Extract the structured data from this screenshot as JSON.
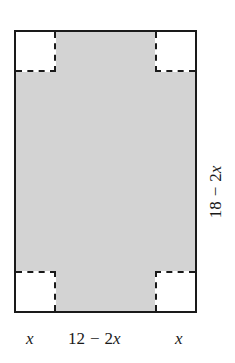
{
  "figure": {
    "kind": "geometry-diagram",
    "colors": {
      "outline": "#1a1a1a",
      "shaded_fill": "#d3d3d3",
      "cutout_fill": "#ffffff",
      "background": "#ffffff"
    },
    "sheet": {
      "outer_width_label": "12",
      "outer_height_label": "18",
      "corner_cut_label": "x"
    },
    "labels": {
      "bottom_left": {
        "variable": "x"
      },
      "bottom_middle": {
        "number": "12",
        "operator": "−",
        "coefficient": "2",
        "variable": "x",
        "full": "12 − 2x"
      },
      "bottom_right": {
        "variable": "x"
      },
      "right_side": {
        "number": "18",
        "operator": "−",
        "coefficient": "2",
        "variable": "x",
        "full": "18 − 2x",
        "orientation": "rotated-90-ccw"
      }
    },
    "corners": [
      {
        "name": "top-left",
        "solid_edges": "top,left",
        "dashed_edges": "right,bottom"
      },
      {
        "name": "top-right",
        "solid_edges": "top,right",
        "dashed_edges": "left,bottom"
      },
      {
        "name": "bottom-left",
        "solid_edges": "bottom,left",
        "dashed_edges": "right,top"
      },
      {
        "name": "bottom-right",
        "solid_edges": "bottom,right",
        "dashed_edges": "left,top"
      }
    ]
  }
}
